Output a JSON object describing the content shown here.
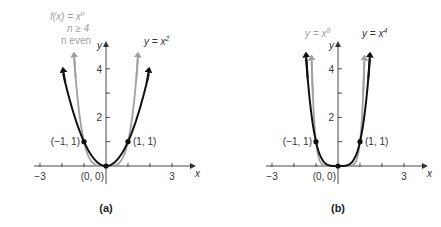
{
  "figure": {
    "panels": [
      {
        "id": "a",
        "caption": "(a)",
        "origin_px": [
          106,
          166
        ],
        "scale_px": [
          22,
          24.3
        ],
        "x_ticks": [
          -3,
          -2,
          -1,
          1,
          2,
          3
        ],
        "x_tick_labels": {
          "-3": "−3",
          "3": "3"
        },
        "y_ticks": [
          1,
          2,
          3,
          4
        ],
        "y_tick_labels": {
          "2": "2",
          "4": "4"
        },
        "x_axis_label": "x",
        "y_axis_label": "y",
        "curves": [
          {
            "name": "y = x^2",
            "power": 2,
            "color": "#111111",
            "xmax": 1.95,
            "label": "y = x",
            "label_exp": "2"
          },
          {
            "name": "f(x) = x^n",
            "power": 4,
            "color": "#a0a0a0",
            "xmax": 1.45,
            "label": "f(x) = x",
            "label_exp": "n",
            "label_line2": "n ≥ 4",
            "label_line3": "n even"
          }
        ],
        "points": [
          {
            "label": "(−1, 1)",
            "x": -1,
            "y": 1
          },
          {
            "label": "(1, 1)",
            "x": 1,
            "y": 1
          },
          {
            "label": "(0, 0)",
            "x": 0,
            "y": 0
          }
        ]
      },
      {
        "id": "b",
        "caption": "(b)",
        "origin_px": [
          338,
          166
        ],
        "scale_px": [
          22,
          24.3
        ],
        "x_ticks": [
          -3,
          -2,
          -1,
          1,
          2,
          3
        ],
        "x_tick_labels": {
          "-3": "−3",
          "3": "3"
        },
        "y_ticks": [
          1,
          2,
          3,
          4
        ],
        "y_tick_labels": {
          "2": "2",
          "4": "4"
        },
        "x_axis_label": "x",
        "y_axis_label": "y",
        "curves": [
          {
            "name": "y = x^4",
            "power": 4,
            "color": "#111111",
            "xmax": 1.45,
            "label": "y = x",
            "label_exp": "4"
          },
          {
            "name": "y = x^8",
            "power": 8,
            "color": "#a0a0a0",
            "xmax": 1.2,
            "label": "y = x",
            "label_exp": "8"
          }
        ],
        "points": [
          {
            "label": "(−1, 1)",
            "x": -1,
            "y": 1
          },
          {
            "label": "(1, 1)",
            "x": 1,
            "y": 1
          },
          {
            "label": "(0, 0)",
            "x": 0,
            "y": 0
          }
        ]
      }
    ]
  }
}
